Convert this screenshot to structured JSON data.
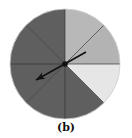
{
  "figure": {
    "caption": "(b)",
    "type": "spinner",
    "center": [
      65,
      64
    ],
    "radius": 55,
    "sectors": [
      {
        "index": 0,
        "start_deg": -90,
        "end_deg": -45,
        "color": "#b8b8b8",
        "shade": "light"
      },
      {
        "index": 1,
        "start_deg": -45,
        "end_deg": 0,
        "color": "#b3b3b3",
        "shade": "light"
      },
      {
        "index": 2,
        "start_deg": 0,
        "end_deg": 45,
        "color": "#e6e6e6",
        "shade": "lightest"
      },
      {
        "index": 3,
        "start_deg": 45,
        "end_deg": 90,
        "color": "#5f5f5f",
        "shade": "dark"
      },
      {
        "index": 4,
        "start_deg": 90,
        "end_deg": 135,
        "color": "#5f5f5f",
        "shade": "dark"
      },
      {
        "index": 5,
        "start_deg": 135,
        "end_deg": 180,
        "color": "#5f5f5f",
        "shade": "dark"
      },
      {
        "index": 6,
        "start_deg": 180,
        "end_deg": 225,
        "color": "#5f5f5f",
        "shade": "dark"
      },
      {
        "index": 7,
        "start_deg": 225,
        "end_deg": 270,
        "color": "#5f5f5f",
        "shade": "dark"
      }
    ],
    "arrow": {
      "tail": [
        86,
        52
      ],
      "head": [
        36,
        80
      ],
      "color": "#111111"
    },
    "divider_color": "#333333"
  }
}
